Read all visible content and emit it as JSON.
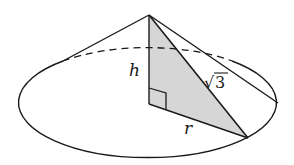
{
  "figure": {
    "type": "cone-cross-section",
    "labels": {
      "height": "h",
      "radius": "r",
      "slant": "3",
      "slant_prefix": "√"
    },
    "colors": {
      "stroke": "#1a1a1a",
      "shading": "#d6d6d6",
      "background": "#ffffff"
    },
    "geometry": {
      "apex": [
        149,
        15
      ],
      "base_center": [
        149,
        104
      ],
      "base_ellipse": {
        "cx": 149,
        "cy": 103,
        "rx": 129,
        "ry": 55
      },
      "triangle_base_vertex": [
        248,
        138
      ],
      "left_tangent": [
        63,
        61
      ],
      "right_tangent": [
        232,
        61
      ]
    },
    "annotations": [
      {
        "text": "h",
        "meaning": "height of cone"
      },
      {
        "text": "r",
        "meaning": "radius of base"
      },
      {
        "text": "√3",
        "meaning": "slant height"
      },
      {
        "text": "right-angle",
        "meaning": "right angle between h and r"
      }
    ]
  }
}
